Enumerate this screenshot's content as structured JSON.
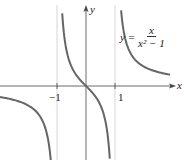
{
  "chart_data": {
    "type": "line",
    "title": "",
    "function": "y = x/(x^2 - 1)",
    "formula_label": {
      "lhs": "y =",
      "numerator": "x",
      "denominator": "x² − 1"
    },
    "xlabel": "x",
    "ylabel": "y",
    "x_ticks": [
      "−1",
      "1"
    ],
    "asymptotes": {
      "vertical": [
        -1,
        1
      ],
      "horizontal": [
        0
      ]
    },
    "xlim": [
      -3,
      3
    ],
    "ylim": [
      -2.5,
      3
    ],
    "grid": false,
    "series": [
      {
        "name": "left branch",
        "x": [
          -2.9,
          -2,
          -1.5,
          -1.2,
          -1.12
        ],
        "y": [
          -0.39,
          -0.67,
          -1.2,
          -2.73,
          -4.4
        ]
      },
      {
        "name": "middle branch",
        "x": [
          -0.82,
          -0.5,
          0,
          0.5,
          0.82
        ],
        "y": [
          2.5,
          0.67,
          0,
          -0.67,
          -2.5
        ]
      },
      {
        "name": "right branch",
        "x": [
          1.22,
          1.5,
          2,
          2.9
        ],
        "y": [
          2.5,
          1.2,
          0.67,
          0.39
        ]
      }
    ]
  },
  "labels": {
    "x_axis": "x",
    "y_axis": "y",
    "tick_neg1": "−1",
    "tick_pos1": "1"
  }
}
